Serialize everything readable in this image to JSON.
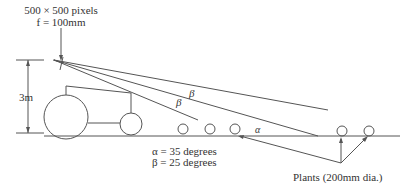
{
  "camera": {
    "resolution_label": "500 × 500 pixels",
    "focal_label": "f = 100mm"
  },
  "height_label": "3m",
  "angle_labels": {
    "beta_upper": "β",
    "beta_lower": "β",
    "alpha": "α"
  },
  "legend": {
    "alpha_line": "α = 35 degrees",
    "beta_line": "β = 25 degrees"
  },
  "plants_label": "Plants (200mm dia.)",
  "colors": {
    "line": "#555555",
    "text": "#333333",
    "background": "#ffffff"
  }
}
